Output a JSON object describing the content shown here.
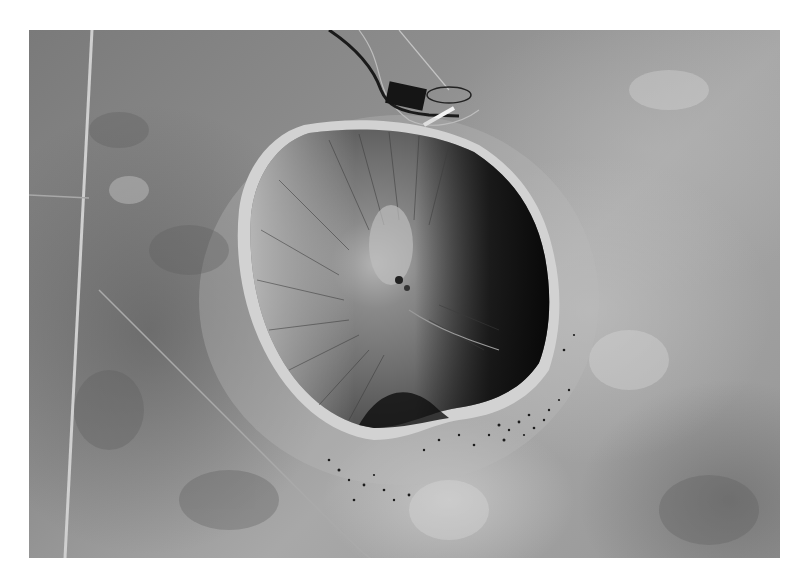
{
  "image": {
    "subject": "Aerial black-and-white photograph of a large meteor impact crater in desert terrain",
    "colors": {
      "background": "#ffffff",
      "terrain_mid": "#8e8e8e",
      "terrain_light": "#c8c8c8",
      "crater_shadow": "#111111",
      "crater_floor": "#7c7c7c",
      "crater_center": "#b0b0b0"
    },
    "features": [
      "straight north-south road on left",
      "curving dark access road at top",
      "visitor building at north rim",
      "crater with shadowed east wall",
      "light central crater floor",
      "scattered ejecta blocks to southeast"
    ]
  }
}
